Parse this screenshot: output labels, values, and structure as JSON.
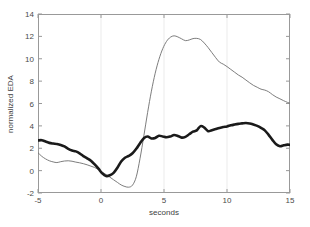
{
  "figure": {
    "background_color": "#ffffff",
    "plot_box": {
      "left": 38,
      "top": 14,
      "right": 290,
      "bottom": 193
    },
    "axis_color": "#999999",
    "gridline_color": "#ebebeb"
  },
  "chart_data": {
    "type": "line",
    "title": "",
    "xlabel": "seconds",
    "ylabel": "normalized EDA",
    "xlim": [
      -5,
      15
    ],
    "ylim": [
      -2,
      14
    ],
    "xticks": [
      -5,
      0,
      5,
      10,
      15
    ],
    "xticklabels": [
      "-5",
      "0",
      "5",
      "10",
      "15"
    ],
    "yticks": [
      -2,
      0,
      2,
      4,
      6,
      8,
      10,
      12,
      14
    ],
    "yticklabels": [
      "-2",
      "0",
      "2",
      "4",
      "6",
      "8",
      "10",
      "12",
      "14"
    ],
    "grid": "vertical-faint",
    "gridlines_x": [
      0,
      5,
      10
    ],
    "legend": "none",
    "legend_position": "none",
    "series": [
      {
        "name": "thick-black-trace",
        "color": "#1a1a1a",
        "linewidth": 2.6,
        "x": [
          -5.0,
          -4.7,
          -4.4,
          -4.1,
          -3.8,
          -3.5,
          -3.2,
          -2.9,
          -2.6,
          -2.3,
          -2.0,
          -1.7,
          -1.4,
          -1.1,
          -0.8,
          -0.5,
          -0.2,
          0.1,
          0.4,
          0.7,
          1.0,
          1.3,
          1.6,
          1.9,
          2.2,
          2.5,
          2.8,
          3.1,
          3.4,
          3.7,
          4.0,
          4.3,
          4.6,
          4.9,
          5.2,
          5.5,
          5.8,
          6.1,
          6.4,
          6.7,
          7.0,
          7.3,
          7.6,
          7.9,
          8.2,
          8.5,
          8.8,
          9.1,
          9.4,
          9.7,
          10.0,
          10.3,
          10.6,
          10.9,
          11.2,
          11.5,
          11.8,
          12.1,
          12.4,
          12.7,
          13.0,
          13.3,
          13.6,
          13.9,
          14.2,
          14.5,
          14.8,
          15.0
        ],
        "y": [
          2.7,
          2.72,
          2.6,
          2.48,
          2.42,
          2.38,
          2.3,
          2.16,
          1.95,
          1.8,
          1.72,
          1.55,
          1.3,
          1.1,
          0.88,
          0.55,
          0.18,
          -0.25,
          -0.48,
          -0.42,
          -0.2,
          0.25,
          0.82,
          1.15,
          1.32,
          1.55,
          1.95,
          2.45,
          2.9,
          3.05,
          2.88,
          2.92,
          3.12,
          3.05,
          2.98,
          3.05,
          3.18,
          3.1,
          2.95,
          3.02,
          3.25,
          3.48,
          3.6,
          3.98,
          3.85,
          3.52,
          3.62,
          3.72,
          3.82,
          3.9,
          3.95,
          4.05,
          4.12,
          4.18,
          4.22,
          4.26,
          4.22,
          4.12,
          4.0,
          3.82,
          3.6,
          3.2,
          2.75,
          2.35,
          2.18,
          2.26,
          2.32,
          2.3
        ]
      },
      {
        "name": "thin-gray-trace",
        "color": "#6e6e6e",
        "linewidth": 0.9,
        "x": [
          -5.0,
          -4.7,
          -4.4,
          -4.1,
          -3.8,
          -3.5,
          -3.2,
          -2.9,
          -2.6,
          -2.3,
          -2.0,
          -1.7,
          -1.4,
          -1.1,
          -0.8,
          -0.5,
          -0.2,
          0.1,
          0.4,
          0.7,
          1.0,
          1.3,
          1.6,
          1.9,
          2.2,
          2.5,
          2.8,
          3.1,
          3.4,
          3.7,
          4.0,
          4.3,
          4.6,
          4.9,
          5.2,
          5.5,
          5.8,
          6.1,
          6.4,
          6.7,
          7.0,
          7.3,
          7.6,
          7.9,
          8.2,
          8.5,
          8.8,
          9.1,
          9.4,
          9.7,
          10.0,
          10.3,
          10.6,
          10.9,
          11.2,
          11.5,
          11.8,
          12.1,
          12.4,
          12.7,
          13.0,
          13.3,
          13.6,
          13.9,
          14.2,
          14.5,
          14.8,
          15.0
        ],
        "y": [
          1.6,
          1.28,
          1.05,
          0.88,
          0.78,
          0.72,
          0.8,
          0.86,
          0.88,
          0.84,
          0.76,
          0.7,
          0.62,
          0.52,
          0.4,
          0.28,
          0.1,
          -0.12,
          -0.35,
          -0.58,
          -0.82,
          -1.05,
          -1.28,
          -1.42,
          -1.48,
          -1.3,
          -0.55,
          1.1,
          3.1,
          5.2,
          7.1,
          8.7,
          9.95,
          10.9,
          11.55,
          11.92,
          12.05,
          11.95,
          11.78,
          11.62,
          11.68,
          11.8,
          11.82,
          11.72,
          11.4,
          11.0,
          10.55,
          10.1,
          9.7,
          9.52,
          9.3,
          9.05,
          8.8,
          8.55,
          8.35,
          8.1,
          7.85,
          7.62,
          7.45,
          7.28,
          7.2,
          7.05,
          6.8,
          6.58,
          6.42,
          6.25,
          6.1,
          6.02
        ]
      }
    ]
  }
}
